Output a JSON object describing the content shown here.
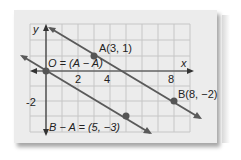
{
  "diagram": {
    "axes": {
      "x_label": "x",
      "y_label": "y"
    },
    "tick_labels": {
      "x": [
        "2",
        "4",
        "8"
      ],
      "y": [
        "-2"
      ]
    },
    "points": [
      {
        "label": "A(3, 1)",
        "x": 3,
        "y": 1
      },
      {
        "label": "B(8, −2)",
        "x": 8,
        "y": -2
      },
      {
        "label": "O = (A − A)",
        "x": 0,
        "y": 0
      },
      {
        "label": "B − A = (5, −3)",
        "x": 5,
        "y": -3
      }
    ],
    "colors": {
      "line": "#555555",
      "grid": "#c4c4c4",
      "axis": "#333333",
      "card": "#ececec"
    }
  }
}
